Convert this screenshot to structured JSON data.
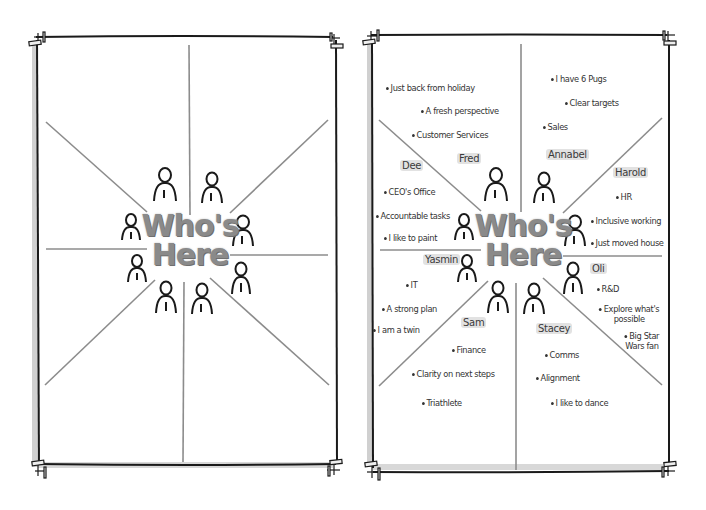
{
  "left_panel": {
    "title_line1": "Who's",
    "title_line2": "Here",
    "person_icons": 8
  },
  "right_panel": {
    "title_line1": "Who's",
    "title_line2": "Here",
    "people": [
      {
        "name": "Fred",
        "notes": [
          "Just back from holiday",
          "A fresh perspective",
          "Customer Services"
        ]
      },
      {
        "name": "Annabel",
        "notes": [
          "I have 6 Pugs",
          "Clear targets",
          "Sales"
        ]
      },
      {
        "name": "Harold",
        "notes": [
          "HR",
          "Inclusive working",
          "Just moved house"
        ]
      },
      {
        "name": "Oli",
        "notes": [
          "R&D",
          "Explore what's possible",
          "Big Star Wars fan"
        ]
      },
      {
        "name": "Stacey",
        "notes": [
          "Comms",
          "Alignment",
          "I like to dance"
        ]
      },
      {
        "name": "Sam",
        "notes": [
          "Finance",
          "Clarity on next steps",
          "Triathlete"
        ]
      },
      {
        "name": "Yasmin",
        "notes": [
          "IT",
          "A strong plan",
          "I am a twin"
        ]
      },
      {
        "name": "Dee",
        "notes": [
          "CEO's Office",
          "Accountable tasks",
          "I like to paint"
        ]
      }
    ]
  },
  "colors": {
    "frame": "#1a1a1a",
    "divider": "#8c8c8c",
    "title": "#8a8a8a",
    "name_highlight": "#c8c8c8",
    "shadow": "#d6d6d6"
  }
}
